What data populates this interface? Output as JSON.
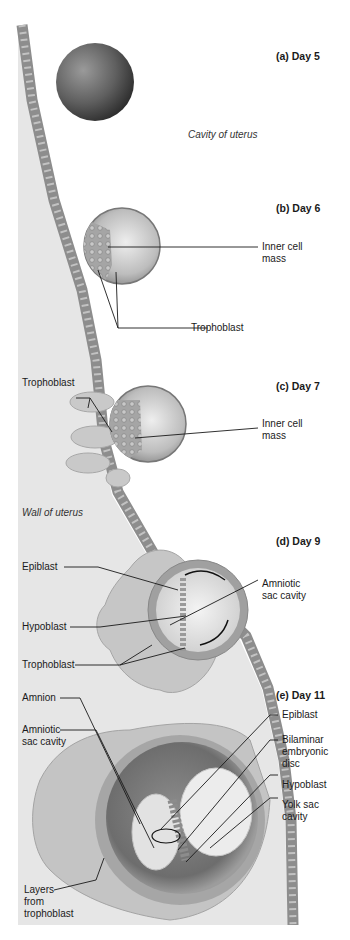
{
  "stages": [
    {
      "id": "a",
      "label": "(a) Day 5"
    },
    {
      "id": "b",
      "label": "(b) Day 6"
    },
    {
      "id": "c",
      "label": "(c) Day 7"
    },
    {
      "id": "d",
      "label": "(d) Day 9"
    },
    {
      "id": "e",
      "label": "(e) Day 11"
    }
  ],
  "regions": {
    "cavity": "Cavity of uterus",
    "wall": "Wall of uterus"
  },
  "labels": {
    "b_inner_cell_mass": "Inner cell\nmass",
    "b_trophoblast": "Trophoblast",
    "c_trophoblast": "Trophoblast",
    "c_inner_cell_mass": "Inner cell\nmass",
    "d_epiblast": "Epiblast",
    "d_amniotic": "Amniotic\nsac cavity",
    "d_hypoblast": "Hypoblast",
    "d_trophoblast": "Trophoblast",
    "e_amnion": "Amnion",
    "e_amniotic": "Amniotic\nsac cavity",
    "e_epiblast": "Epiblast",
    "e_bilaminar": "Bilaminar\nembryonic\ndisc",
    "e_hypoblast": "Hypoblast",
    "e_yolk": "Yolk sac\ncavity",
    "e_layers": "Layers\nfrom\ntrophoblast"
  },
  "colors": {
    "wall": "#e6e6e6",
    "cells": "#9a9a9a",
    "leader": "#1a1a1a"
  }
}
